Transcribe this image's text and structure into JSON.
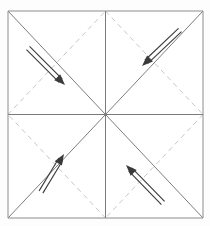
{
  "figure": {
    "caption": "Origami crease pattern: square sheet with both solid diagonals, solid vertical and horizontal center creases, dashed quadrant diagonals, and four arrows folding each corner region toward the center.",
    "background_color": "#fdfdfd",
    "paper_fill": "#ffffff"
  },
  "colors": {
    "frame_line": "#8c8c8c",
    "solid_crease": "#6e6e6e",
    "center_line": "#7a7a7a",
    "dashed_crease": "#bfbfbf",
    "arrow": "#3a3a3a"
  },
  "strokes": {
    "frame_width": "1",
    "solid_width": "0.9",
    "center_width": "1",
    "dashed_width": "0.9",
    "dash_pattern": "5 4",
    "arrow_width": "1.1"
  },
  "paper": {
    "name": "square-sheet",
    "left": 8,
    "top": 11,
    "right": 203,
    "bottom": 218,
    "center_x": 105.5,
    "center_y": 114.5
  },
  "creases": {
    "frame": [
      {
        "name": "paper-edge-top",
        "x1": 8,
        "y1": 11,
        "x2": 203,
        "y2": 11
      },
      {
        "name": "paper-edge-right",
        "x1": 203,
        "y1": 11,
        "x2": 203,
        "y2": 218
      },
      {
        "name": "paper-edge-bottom",
        "x1": 8,
        "y1": 218,
        "x2": 203,
        "y2": 218
      },
      {
        "name": "paper-edge-left",
        "x1": 8,
        "y1": 11,
        "x2": 8,
        "y2": 218
      }
    ],
    "solid": [
      {
        "name": "diagonal-tl-br",
        "x1": 8,
        "y1": 11,
        "x2": 203,
        "y2": 218
      },
      {
        "name": "diagonal-bl-tr",
        "x1": 8,
        "y1": 218,
        "x2": 203,
        "y2": 11
      }
    ],
    "center": [
      {
        "name": "center-crease-vertical",
        "x1": 105.5,
        "y1": 11,
        "x2": 105.5,
        "y2": 218
      },
      {
        "name": "center-crease-horizontal",
        "x1": 8,
        "y1": 114.5,
        "x2": 203,
        "y2": 114.5
      }
    ],
    "dashed": [
      {
        "name": "dashed-crease-top-left",
        "x1": 8,
        "y1": 114.5,
        "x2": 105.5,
        "y2": 11
      },
      {
        "name": "dashed-crease-top-right",
        "x1": 105.5,
        "y1": 11,
        "x2": 203,
        "y2": 114.5
      },
      {
        "name": "dashed-crease-bottom-right",
        "x1": 203,
        "y1": 114.5,
        "x2": 105.5,
        "y2": 218
      },
      {
        "name": "dashed-crease-bottom-left",
        "x1": 105.5,
        "y1": 218,
        "x2": 8,
        "y2": 114.5
      }
    ]
  },
  "arrows": [
    {
      "name": "fold-arrow-top-left",
      "quadrant": "top-left",
      "direction": "down-right",
      "tail_x": 28,
      "tail_y": 48,
      "head_x": 65,
      "head_y": 85
    },
    {
      "name": "fold-arrow-top-right",
      "quadrant": "top-right",
      "direction": "down-left",
      "tail_x": 180,
      "tail_y": 30,
      "head_x": 142,
      "head_y": 66
    },
    {
      "name": "fold-arrow-bottom-left",
      "quadrant": "bottom-left",
      "direction": "up-right",
      "tail_x": 41,
      "tail_y": 192,
      "head_x": 64,
      "head_y": 154
    },
    {
      "name": "fold-arrow-bottom-right",
      "quadrant": "bottom-right",
      "direction": "up-left",
      "tail_x": 163,
      "tail_y": 203,
      "head_x": 126,
      "head_y": 165
    }
  ]
}
